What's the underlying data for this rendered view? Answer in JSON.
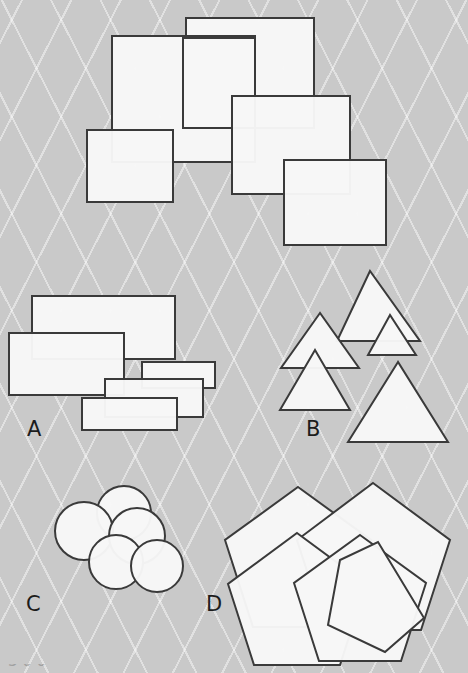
{
  "figure": {
    "background_color": "#c9c9c9",
    "shape_fill": "#f7f7f7",
    "shape_stroke": "#3a3a3a",
    "width": 468,
    "height": 673,
    "partial_caption": "3 0 0"
  },
  "panels": [
    {
      "id": "top",
      "label": "",
      "shape_type": "rectangle",
      "count": 5,
      "shapes": [
        {
          "name": "rect-top-right-large",
          "x": 186,
          "y": 18,
          "w": 128,
          "h": 110
        },
        {
          "name": "rect-top-left-large",
          "x": 112,
          "y": 36,
          "w": 143,
          "h": 126
        },
        {
          "name": "rect-middle-tall",
          "x": 183,
          "y": 38,
          "w": 72,
          "h": 90
        },
        {
          "name": "rect-mid-right",
          "x": 232,
          "y": 96,
          "w": 118,
          "h": 98
        },
        {
          "name": "rect-left-small",
          "x": 87,
          "y": 130,
          "w": 86,
          "h": 72
        },
        {
          "name": "rect-bottom-right",
          "x": 284,
          "y": 160,
          "w": 102,
          "h": 85
        }
      ]
    },
    {
      "id": "A",
      "label": "A",
      "label_x": 27,
      "label_y": 436,
      "shape_type": "rectangle",
      "count": 5,
      "shapes": [
        {
          "name": "rect-a-1",
          "x": 32,
          "y": 296,
          "w": 143,
          "h": 63
        },
        {
          "name": "rect-a-2",
          "x": 9,
          "y": 333,
          "w": 115,
          "h": 62
        },
        {
          "name": "rect-a-3",
          "x": 142,
          "y": 362,
          "w": 73,
          "h": 26
        },
        {
          "name": "rect-a-4",
          "x": 105,
          "y": 379,
          "w": 98,
          "h": 38
        },
        {
          "name": "rect-a-5",
          "x": 82,
          "y": 398,
          "w": 95,
          "h": 32
        }
      ]
    },
    {
      "id": "B",
      "label": "B",
      "label_x": 306,
      "label_y": 436,
      "shape_type": "triangle",
      "count": 5,
      "shapes": [
        {
          "name": "tri-b-1",
          "points": "370,271 337,341 420,341"
        },
        {
          "name": "tri-b-2",
          "points": "320,313 281,368 359,368"
        },
        {
          "name": "tri-b-3",
          "points": "390,315 368,355 416,355"
        },
        {
          "name": "tri-b-4",
          "points": "315,350 280,410 350,410"
        },
        {
          "name": "tri-b-5",
          "points": "398,362 348,442 448,442"
        }
      ]
    },
    {
      "id": "C",
      "label": "C",
      "label_x": 26,
      "label_y": 611,
      "shape_type": "circle",
      "count": 5,
      "shapes": [
        {
          "name": "circ-c-1",
          "cx": 124,
          "cy": 513,
          "r": 27
        },
        {
          "name": "circ-c-2",
          "cx": 84,
          "cy": 531,
          "r": 29
        },
        {
          "name": "circ-c-3",
          "cx": 137,
          "cy": 536,
          "r": 28
        },
        {
          "name": "circ-c-4",
          "cx": 116,
          "cy": 562,
          "r": 27
        },
        {
          "name": "circ-c-5",
          "cx": 157,
          "cy": 566,
          "r": 26
        }
      ]
    },
    {
      "id": "D",
      "label": "D",
      "label_x": 206,
      "label_y": 611,
      "shape_type": "pentagon",
      "count": 5,
      "shapes": [
        {
          "name": "pent-d-1",
          "points": "298,487 371,540 343,627 253,627 225,540"
        },
        {
          "name": "pent-d-2",
          "points": "373,483 450,540 421,630 326,630 297,540"
        },
        {
          "name": "pent-d-3",
          "points": "297,533 366,584 340,665 254,665 228,584"
        },
        {
          "name": "pent-d-4",
          "points": "360,535 426,583 401,661 319,661 294,583"
        },
        {
          "name": "pent-d-5",
          "points": "378,542 424,618 385,652 328,625 340,560"
        }
      ]
    }
  ]
}
